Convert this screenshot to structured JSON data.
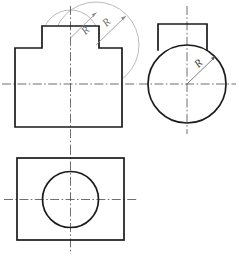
{
  "drawing": {
    "title": "Orthographic projection - cylindrical boss on rectangular block",
    "sheet": {
      "width": 239,
      "height": 258,
      "background": "#ffffff"
    },
    "style": {
      "outline_color": "#1b1b1b",
      "construction_color": "#a9a9a9",
      "centerline_color": "#4a4a4a",
      "leader_color": "#8d8d8d",
      "leader_color_dark": "#5c5c5c",
      "label_color": "#6f6f6f",
      "label_color_dark": "#3c3c3c"
    },
    "views": [
      {
        "id": "front-view",
        "name": "front-view",
        "outline_points": "15,48 42,48 42,26 99,26 99,48 122,48 122,127 15,127",
        "centerline_vertical": {
          "x": 70.5,
          "y1": 6,
          "y2": 146
        },
        "centerline_horizontal": {
          "y": 84,
          "x1": 2,
          "x2": 137
        },
        "construction_circles": [
          {
            "name": "construction-circle-small",
            "cx": 70.5,
            "cy": 38,
            "r": 28
          },
          {
            "name": "construction-circle-large",
            "cx": 96,
            "cy": 45,
            "r": 43
          }
        ],
        "dimensions": [
          {
            "label": "R",
            "name": "radius-label-small",
            "leader": {
              "x1": 70.5,
              "y1": 38,
              "x2": 96.5,
              "y2": 12.5
            },
            "text_x": 86,
            "text_y": 31,
            "rotation": -45
          },
          {
            "label": "R",
            "name": "radius-label-large",
            "leader": {
              "x1": 96,
              "y1": 45,
              "x2": 126,
              "y2": 16
            },
            "text_x": 107,
            "text_y": 23,
            "rotation": -45
          }
        ]
      },
      {
        "id": "right-side-view",
        "name": "right-side-view",
        "boss_rect": {
          "x": 158,
          "y": 24,
          "width": 49,
          "height": 26
        },
        "circle": {
          "cx": 187,
          "cy": 84,
          "r": 39
        },
        "centerline_vertical": {
          "x": 187,
          "y1": 6,
          "y2": 134
        },
        "centerline_horizontal": {
          "y": 84,
          "x1": 139,
          "x2": 236
        },
        "dimensions": [
          {
            "label": "R",
            "name": "radius-label-side",
            "leader": {
              "x1": 187,
              "y1": 84,
              "x2": 216,
              "y2": 56
            },
            "text_x": 199,
            "text_y": 64,
            "rotation": -45
          }
        ]
      },
      {
        "id": "top-view",
        "name": "top-view",
        "rect": {
          "x": 17,
          "y": 158,
          "width": 107,
          "height": 82
        },
        "circle": {
          "cx": 70.5,
          "cy": 199.5,
          "r": 28
        },
        "centerline_vertical": {
          "x": 70.5,
          "y1": 146,
          "y2": 254
        },
        "centerline_horizontal": {
          "y": 199.5,
          "x1": 4,
          "x2": 137
        }
      }
    ]
  }
}
